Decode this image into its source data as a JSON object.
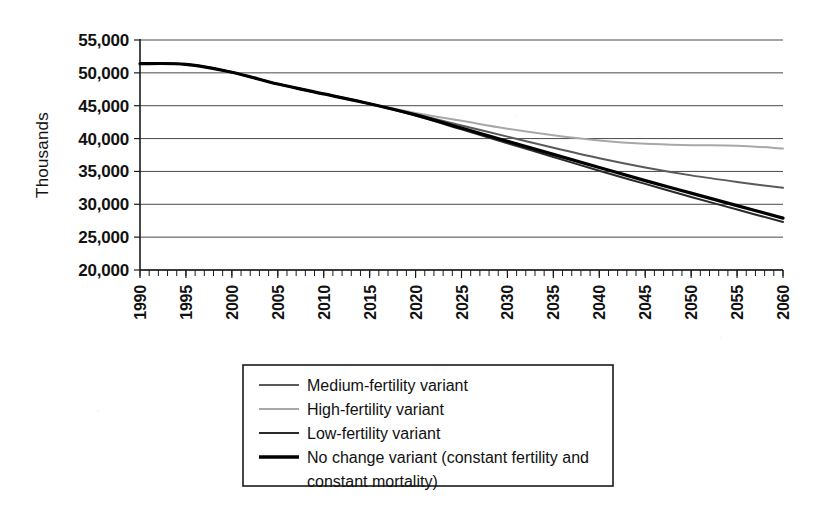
{
  "chart_data": {
    "type": "line",
    "title": "",
    "subtitle": "",
    "xlabel": "",
    "ylabel": "Thousands",
    "xlim": [
      1990,
      2060
    ],
    "ylim": [
      20000,
      55000
    ],
    "ytick_step": 5000,
    "xtick_step": 5,
    "minor_xtick_step": 1,
    "grid": "horizontal",
    "legend_position": "bottom-center",
    "ytick_labels": [
      "55,000",
      "50,000",
      "45,000",
      "40,000",
      "35,000",
      "30,000",
      "25,000",
      "20,000"
    ],
    "ytick_values": [
      55000,
      50000,
      45000,
      40000,
      35000,
      30000,
      25000,
      20000
    ],
    "xtick_labels": [
      "1990",
      "1995",
      "2000",
      "2005",
      "2010",
      "2015",
      "2020",
      "2025",
      "2030",
      "2035",
      "2040",
      "2045",
      "2050",
      "2055",
      "2060"
    ],
    "xtick_values": [
      1990,
      1995,
      2000,
      2005,
      2010,
      2015,
      2020,
      2025,
      2030,
      2035,
      2040,
      2045,
      2050,
      2055,
      2060
    ],
    "x": [
      1990,
      1995,
      2000,
      2005,
      2010,
      2015,
      2020,
      2025,
      2030,
      2035,
      2040,
      2045,
      2050,
      2055,
      2060
    ],
    "series": [
      {
        "name": "Medium-fertility variant",
        "color": "#5a5a5a",
        "width": 2.0,
        "values": [
          51400,
          51300,
          50100,
          48300,
          46800,
          45300,
          43700,
          42000,
          40300,
          38600,
          37000,
          35600,
          34400,
          33400,
          32500
        ]
      },
      {
        "name": "High-fertility variant",
        "color": "#a8a8a8",
        "width": 2.0,
        "values": [
          51400,
          51300,
          50100,
          48300,
          46800,
          45300,
          43900,
          42700,
          41500,
          40500,
          39700,
          39200,
          39000,
          38900,
          38500
        ]
      },
      {
        "name": "Low-fertility variant",
        "color": "#2a2a2a",
        "width": 2.0,
        "values": [
          51400,
          51300,
          50100,
          48300,
          46800,
          45300,
          43500,
          41400,
          39300,
          37200,
          35100,
          33100,
          31100,
          29200,
          27300
        ]
      },
      {
        "name": "No change variant (constant fertility and constant mortality)",
        "color": "#000000",
        "width": 3.2,
        "values": [
          51400,
          51300,
          50100,
          48300,
          46800,
          45300,
          43600,
          41600,
          39600,
          37600,
          35600,
          33600,
          31700,
          29800,
          27900
        ]
      }
    ]
  },
  "axis": {
    "y_title": "Thousands"
  },
  "legend": {
    "entries": [
      {
        "label": "Medium-fertility variant",
        "color": "#5a5a5a",
        "width": 2.0
      },
      {
        "label": "High-fertility variant",
        "color": "#a8a8a8",
        "width": 2.0
      },
      {
        "label": "Low-fertility variant",
        "color": "#2a2a2a",
        "width": 2.0
      },
      {
        "label": "No change variant (constant fertility and",
        "color": "#000000",
        "width": 3.4
      },
      {
        "label": "constant mortality)",
        "color": "",
        "width": 0
      }
    ]
  }
}
